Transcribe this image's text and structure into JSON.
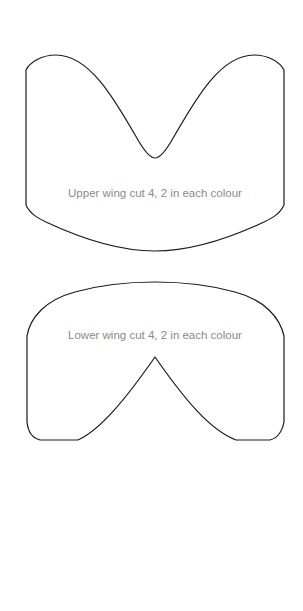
{
  "template": {
    "pieces": [
      {
        "id": "upper-wing",
        "label": "Upper wing cut 4, 2 in each colour"
      },
      {
        "id": "lower-wing",
        "label": "Lower wing cut 4, 2 in each colour"
      }
    ]
  }
}
